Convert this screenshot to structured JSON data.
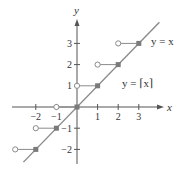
{
  "chart_data": {
    "type": "line",
    "title": "",
    "xlabel": "x",
    "ylabel": "y",
    "xlim": [
      -3.0,
      4.0
    ],
    "ylim": [
      -2.8,
      4.2
    ],
    "grid": false,
    "xticks": [
      -2,
      -1,
      1,
      2,
      3
    ],
    "xtick_labels": [
      "−2",
      "−1",
      "1",
      "2",
      "3"
    ],
    "yticks": [
      -2,
      -1,
      1,
      2,
      3
    ],
    "ytick_labels": [
      "−2",
      "−1",
      "1",
      "2",
      "3"
    ],
    "series": [
      {
        "name": "y = x",
        "kind": "line",
        "x": [
          -2.6,
          4.0
        ],
        "y": [
          -2.6,
          4.0
        ],
        "color": "#8a8a8a"
      },
      {
        "name": "y = ⌈x⌉",
        "kind": "step",
        "segments": [
          {
            "x_start": -3,
            "x_end": -2,
            "y": -2,
            "start": "open",
            "end": "closed"
          },
          {
            "x_start": -2,
            "x_end": -1,
            "y": -1,
            "start": "open",
            "end": "closed"
          },
          {
            "x_start": -1,
            "x_end": 0,
            "y": 0,
            "start": "open",
            "end": "closed"
          },
          {
            "x_start": 0,
            "x_end": 1,
            "y": 1,
            "start": "open",
            "end": "closed"
          },
          {
            "x_start": 1,
            "x_end": 2,
            "y": 2,
            "start": "open",
            "end": "closed"
          },
          {
            "x_start": 2,
            "x_end": 3,
            "y": 3,
            "start": "open",
            "end": "closed"
          }
        ],
        "color": "#8a8a8a"
      }
    ],
    "annotations": [
      {
        "text": "y = x",
        "x": 3.6,
        "y": 3.1
      },
      {
        "text": "y = ⌈x⌉",
        "x": 2.3,
        "y": 1.1
      }
    ]
  },
  "labels": {
    "x_axis": "x",
    "y_axis": "y",
    "identity_line": "y = x",
    "ceiling_function": "y = ⌈x⌉"
  }
}
